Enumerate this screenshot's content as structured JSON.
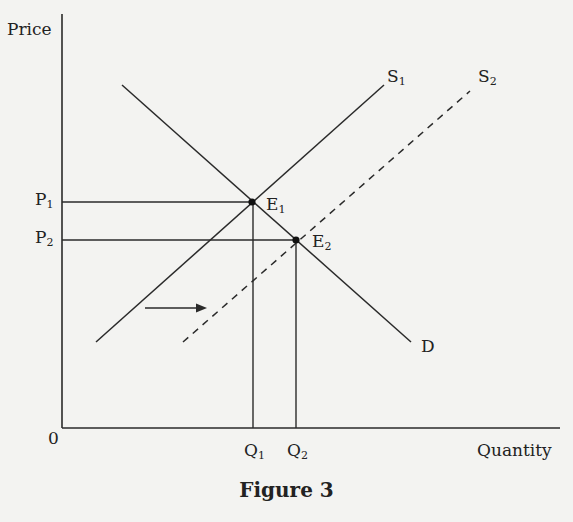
{
  "axes": {
    "y_label": "Price",
    "x_label": "Quantity",
    "origin": "0"
  },
  "price_labels": [
    {
      "main": "P",
      "sub": "1"
    },
    {
      "main": "P",
      "sub": "2"
    }
  ],
  "quantity_labels": [
    {
      "main": "Q",
      "sub": "1"
    },
    {
      "main": "Q",
      "sub": "2"
    }
  ],
  "curves": {
    "s1": {
      "main": "S",
      "sub": "1"
    },
    "s2": {
      "main": "S",
      "sub": "2"
    },
    "demand": "D"
  },
  "equilibria": [
    {
      "main": "E",
      "sub": "1"
    },
    {
      "main": "E",
      "sub": "2"
    }
  ],
  "caption": "Figure 3",
  "colors": {
    "ink": "#2a2a2a",
    "background": "#f3f3f1"
  }
}
